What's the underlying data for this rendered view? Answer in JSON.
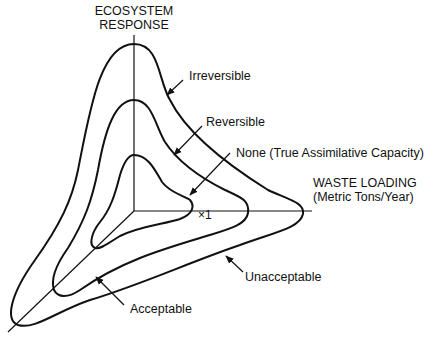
{
  "diagram": {
    "axes": {
      "vertical_label_line1": "ECOSYSTEM",
      "vertical_label_line2": "RESPONSE",
      "horizontal_label_line1": "WASTE LOADING",
      "horizontal_label_line2": "(Metric Tons/Year)",
      "third_axis_marker": "×1"
    },
    "curves": [
      {
        "id": "inner",
        "label": "None (True Assimilative Capacity)"
      },
      {
        "id": "middle",
        "label": "Reversible"
      },
      {
        "id": "outer",
        "label": "Irreversible"
      }
    ],
    "regions": {
      "acceptable": "Acceptable",
      "unacceptable": "Unacceptable"
    },
    "colors": {
      "line": "#111111",
      "background": "#ffffff"
    }
  }
}
